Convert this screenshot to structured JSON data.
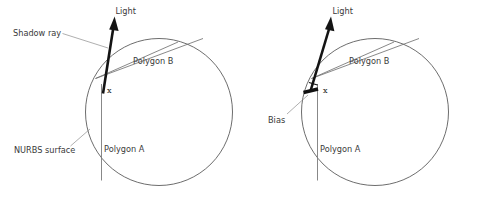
{
  "figure": {
    "type": "diagram",
    "background_color": "#ffffff",
    "width": 481,
    "height": 198
  },
  "colors": {
    "surface_curve": "#5c5c5c",
    "chord": "#6a6a6a",
    "polygon_a": "#7a7a7a",
    "ray": "#141414",
    "bias": "#111111",
    "leader": "#8d8d8d",
    "label_text": "#3a3a3a",
    "point_text": "#1d1d1d"
  },
  "panels": [
    {
      "id": "left",
      "name": "without-bias",
      "labels": {
        "light": "Light",
        "shadow_ray": "Shadow ray",
        "polygon_b": "Polygon B",
        "polygon_a": "Polygon A",
        "nurbs_surface": "NURBS surface",
        "point": "x"
      }
    },
    {
      "id": "right",
      "name": "with-bias",
      "labels": {
        "light": "Light",
        "bias": "Bias",
        "polygon_b": "Polygon B",
        "polygon_a": "Polygon A",
        "point": "x"
      }
    }
  ]
}
